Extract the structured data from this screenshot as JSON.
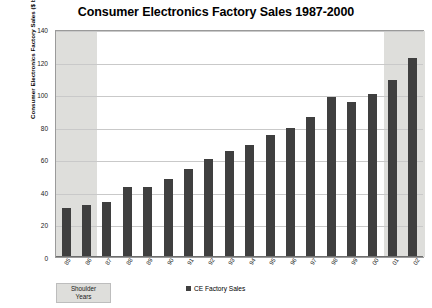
{
  "chart_data": {
    "type": "bar",
    "title": "Consumer Electronics Factory Sales 1987-2000",
    "xlabel": "",
    "ylabel": "Consumer Electronics Factory Sales ($ billion)",
    "ylim": [
      0,
      140
    ],
    "yticks": [
      0,
      20,
      40,
      60,
      80,
      100,
      120,
      140
    ],
    "grid": true,
    "legend_position": "bottom",
    "categories": [
      "85",
      "86",
      "87",
      "88",
      "89",
      "90",
      "91",
      "92",
      "93",
      "94",
      "95",
      "96",
      "97",
      "98",
      "99",
      "00",
      "01",
      "02"
    ],
    "series": [
      {
        "name": "CE Factory Sales",
        "color": "#3f3f3f",
        "values": [
          30,
          32,
          34,
          43,
          43,
          48,
          54,
          60,
          65,
          69,
          75,
          79,
          86,
          98,
          95,
          100,
          109,
          122
        ]
      }
    ],
    "annotations": [
      {
        "name": "shoulder-years",
        "label_line1": "Shoulder",
        "label_line2": "Years",
        "shaded_categories": [
          "85",
          "86",
          "01",
          "02"
        ],
        "shade_color": "#dededb"
      }
    ]
  },
  "legend": {
    "items": [
      {
        "label": "CE Factory Sales",
        "color": "#3f3f3f"
      }
    ]
  }
}
